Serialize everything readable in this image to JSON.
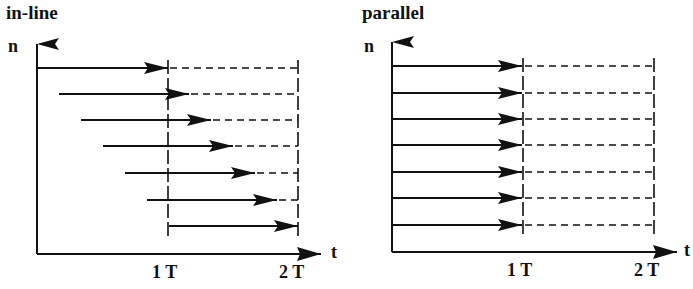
{
  "panels": [
    {
      "title": "in-line",
      "y_axis_label": "n",
      "x_axis_label": "t",
      "ticks": [
        "1 T",
        "2 T"
      ],
      "rows": 7,
      "arrow_type": "staggered"
    },
    {
      "title": "parallel",
      "y_axis_label": "n",
      "x_axis_label": "t",
      "ticks": [
        "1 T",
        "2 T"
      ],
      "rows": 7,
      "arrow_type": "aligned"
    }
  ],
  "colors": {
    "ink": "#111111",
    "background": "#ffffff"
  }
}
